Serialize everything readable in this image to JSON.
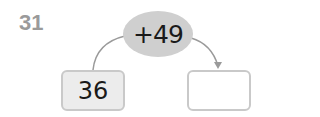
{
  "problem": {
    "number": "31",
    "operation": "+49",
    "start_value": "36",
    "answer_value": ""
  },
  "colors": {
    "number": "#9a9a9a",
    "oval": "#cfcfcf",
    "box_border": "#c9c9c9",
    "start_box_fill": "#ececec",
    "arrow": "#9a9a9a"
  }
}
